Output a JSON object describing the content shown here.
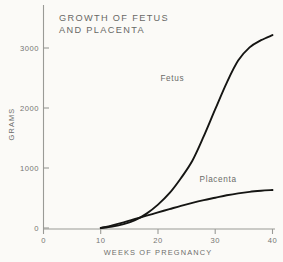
{
  "chart_data": {
    "type": "line",
    "title_line1": "GROWTH OF FETUS",
    "title_line2": "AND PLACENTA",
    "xlabel": "WEEKS OF PREGNANCY",
    "ylabel": "GRAMS",
    "xlim": [
      0,
      40
    ],
    "ylim": [
      0,
      3300
    ],
    "xticks": [
      0,
      10,
      20,
      30,
      40
    ],
    "xticklabels": [
      "0",
      "10",
      "20",
      "30",
      "40"
    ],
    "yticks": [
      0,
      1000,
      2000,
      3000
    ],
    "yticklabels": [
      "0",
      "1000",
      "2000",
      "3000"
    ],
    "grid": false,
    "legend": "inline-labels",
    "x": [
      10,
      12,
      14,
      16,
      18,
      20,
      22,
      24,
      26,
      28,
      30,
      32,
      34,
      36,
      38,
      40
    ],
    "series": [
      {
        "name": "Fetus",
        "label": "Fetus",
        "color": "#151513",
        "label_position": {
          "x": 22.5,
          "y": 2450
        },
        "values": [
          0,
          25,
          65,
          130,
          240,
          390,
          580,
          830,
          1120,
          1530,
          1980,
          2420,
          2790,
          3010,
          3130,
          3215
        ]
      },
      {
        "name": "Placenta",
        "label": "Placenta",
        "color": "#151513",
        "label_position": {
          "x": 30.5,
          "y": 760
        },
        "values": [
          0,
          45,
          95,
          150,
          205,
          260,
          315,
          370,
          420,
          465,
          505,
          545,
          578,
          603,
          620,
          633
        ]
      }
    ]
  }
}
